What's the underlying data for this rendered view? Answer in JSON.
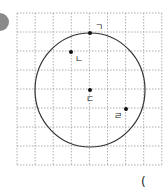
{
  "problem_badge": {
    "color": "#8a8a8a",
    "cx": 0,
    "cy": 22,
    "r": 9
  },
  "grid": {
    "x0": 17,
    "y0": 13,
    "cols": 8,
    "rows": 8,
    "cell_w": 18.1,
    "cell_h": 19,
    "line_color": "#9a9a9a"
  },
  "circle": {
    "cx": 90,
    "cy": 90,
    "rx": 55,
    "ry": 57,
    "stroke": "#333333"
  },
  "points": [
    {
      "id": "giyeok",
      "label": "ㄱ",
      "x": 90,
      "y": 33,
      "lx": 95,
      "ly": 30
    },
    {
      "id": "nieun",
      "label": "ㄴ",
      "x": 71,
      "y": 52,
      "lx": 75,
      "ly": 62
    },
    {
      "id": "digeut",
      "label": "ㄷ",
      "x": 90,
      "y": 90,
      "lx": 86,
      "ly": 102
    },
    {
      "id": "rieul",
      "label": "ㄹ",
      "x": 126,
      "y": 109,
      "lx": 114,
      "ly": 119
    }
  ],
  "stray_mark": {
    "text": "(",
    "x": 141,
    "y": 186
  }
}
